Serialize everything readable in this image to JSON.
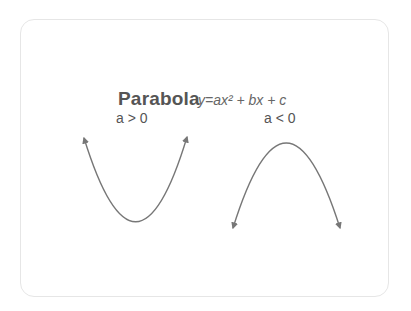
{
  "diagram": {
    "title": "Parabola",
    "formula": "y=ax² + bx + c",
    "panels": [
      {
        "label": "a > 0",
        "shape": "upward-opening parabola"
      },
      {
        "label": "a < 0",
        "shape": "downward-opening parabola"
      }
    ],
    "colors": {
      "curve": "#777777",
      "text": "#555555",
      "border": "#e6e6e6"
    }
  }
}
